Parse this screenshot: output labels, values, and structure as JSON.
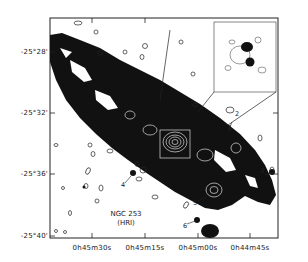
{
  "figure": {
    "object_name": "NGC 253",
    "instrument": "(HRI)",
    "y_axis_ticks": [
      "-25°28'",
      "-25°32'",
      "-25°36'",
      "-25°40'"
    ],
    "x_axis_ticks": [
      "0h45m30s",
      "0h45m15s",
      "0h45m00s",
      "0h44m45s"
    ],
    "source_labels": [
      "1",
      "2",
      "3",
      "4",
      "5",
      "6"
    ],
    "inset_label": "nucleus enlargement",
    "colors": {
      "background": "#ffffff",
      "ink": "#111111",
      "contour_on_dark": "#dddddd"
    }
  }
}
